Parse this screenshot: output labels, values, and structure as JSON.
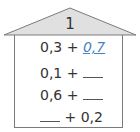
{
  "house": {
    "roof_number": "1",
    "colors": {
      "roof_fill": "#e0e0e0",
      "outline": "#7a7a7a",
      "answer": "#4a7fc1"
    },
    "rows": [
      {
        "left": "0,3",
        "op": "+",
        "right": "0,7",
        "right_is_answer": true
      },
      {
        "left": "0,1",
        "op": "+",
        "right": "",
        "blank": "right"
      },
      {
        "left": "0,6",
        "op": "+",
        "right": "",
        "blank": "right"
      },
      {
        "left": "",
        "op": "+",
        "right": "0,2",
        "blank": "left"
      }
    ]
  }
}
